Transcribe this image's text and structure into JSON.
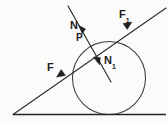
{
  "figure": {
    "background_color": "#fbfbf9",
    "stroke_color": "#2a2a2a",
    "labels": {
      "normal_upper": {
        "text": "N",
        "subscript": ""
      },
      "tangency_point": {
        "text": "P",
        "subscript": ""
      },
      "normal_lower": {
        "text": "N",
        "subscript": "1"
      },
      "force_upper_right": {
        "text": "F",
        "subscript": "1"
      },
      "force_lower_left": {
        "text": "F",
        "subscript": ""
      }
    },
    "geometry": {
      "baseline": {
        "x1": 13,
        "y1": 114.5,
        "x2": 166,
        "y2": 114.5
      },
      "diagonal": {
        "x1": 13,
        "y1": 114.5,
        "x2": 166,
        "y2": 8
      },
      "circle": {
        "cx": 109,
        "cy": 78,
        "r": 36.5
      },
      "normal_line": {
        "x1": 68,
        "y1": 6,
        "x2": 111,
        "y2": 82
      },
      "point_P": {
        "x": 88,
        "y": 42
      }
    },
    "arrows": [
      {
        "name": "arrow-N",
        "tip_x": 82,
        "tip_y": 33,
        "angle_deg": 240
      },
      {
        "name": "arrow-N1",
        "tip_x": 99,
        "tip_y": 64,
        "angle_deg": 60
      },
      {
        "name": "arrow-F1",
        "tip_x": 131,
        "tip_y": 23,
        "angle_deg": 325
      },
      {
        "name": "arrow-F",
        "tip_x": 57,
        "tip_y": 76,
        "angle_deg": 145
      }
    ]
  }
}
